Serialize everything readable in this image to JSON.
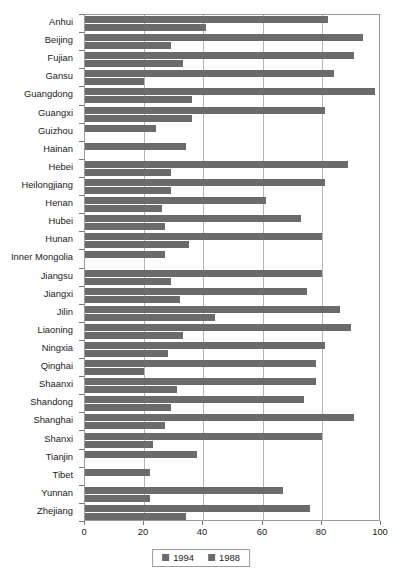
{
  "chart_data": {
    "type": "bar",
    "orientation": "horizontal",
    "title": "",
    "subtitle": "",
    "xlabel": "",
    "ylabel": "",
    "xlim": [
      0,
      100
    ],
    "xticks": [
      0,
      20,
      40,
      60,
      80,
      100
    ],
    "xtick_labels": [
      "0",
      "20",
      "40",
      "60",
      "80",
      "100"
    ],
    "grid": "vertical",
    "legend_position": "bottom-center",
    "bar_color": "#6b6b6b",
    "axis_color": "#9a9a9a",
    "grid_color": "#b5b5b5",
    "categories": [
      "Anhui",
      "Beijing",
      "Fujian",
      "Gansu",
      "Guangdong",
      "Guangxi",
      "Guizhou",
      "Hainan",
      "Hebei",
      "Heilongjiang",
      "Henan",
      "Hubei",
      "Hunan",
      "Inner Mongolia",
      "Jiangsu",
      "Jiangxi",
      "Jilin",
      "Liaoning",
      "Ningxia",
      "Qinghai",
      "Shaanxi",
      "Shandong",
      "Shanghai",
      "Shanxi",
      "Tianjin",
      "Tibet",
      "Yunnan",
      "Zhejiang"
    ],
    "series": [
      {
        "name": "1988",
        "values": [
          82,
          94,
          91,
          84,
          98,
          81,
          24,
          34,
          89,
          81,
          61,
          73,
          80,
          27,
          80,
          75,
          86,
          90,
          81,
          78,
          78,
          74,
          91,
          80,
          38,
          22,
          67,
          76
        ]
      },
      {
        "name": "1994",
        "values": [
          41,
          29,
          33,
          20,
          36,
          36,
          null,
          null,
          29,
          29,
          26,
          27,
          35,
          null,
          29,
          32,
          44,
          33,
          28,
          20,
          31,
          29,
          27,
          23,
          null,
          null,
          22,
          34
        ]
      }
    ]
  },
  "legend": {
    "items": [
      {
        "label": "1994",
        "color": "#6b6b6b"
      },
      {
        "label": "1988",
        "color": "#6b6b6b"
      }
    ]
  }
}
